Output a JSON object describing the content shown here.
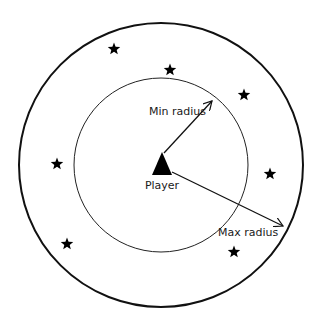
{
  "diagram": {
    "center": {
      "x": 161,
      "y": 165
    },
    "outer_circle": {
      "r": 142,
      "stroke": "#111111",
      "stroke_width": 2
    },
    "inner_circle": {
      "r": 87,
      "stroke": "#222222",
      "stroke_width": 1
    },
    "player": {
      "label": "Player",
      "shape": "triangle",
      "color": "#000000"
    },
    "min_radius": {
      "label": "Min radius",
      "from": {
        "x": 164,
        "y": 153
      },
      "to": {
        "x": 212,
        "y": 101
      }
    },
    "max_radius": {
      "label": "Max radius",
      "from": {
        "x": 172,
        "y": 172
      },
      "to": {
        "x": 283,
        "y": 226
      }
    },
    "stars": [
      {
        "x": 114,
        "y": 49
      },
      {
        "x": 170,
        "y": 70
      },
      {
        "x": 244,
        "y": 95
      },
      {
        "x": 57,
        "y": 164
      },
      {
        "x": 270,
        "y": 174
      },
      {
        "x": 67,
        "y": 244
      },
      {
        "x": 234,
        "y": 252
      }
    ],
    "star_icon": "star-icon",
    "star_color": "#000000"
  }
}
